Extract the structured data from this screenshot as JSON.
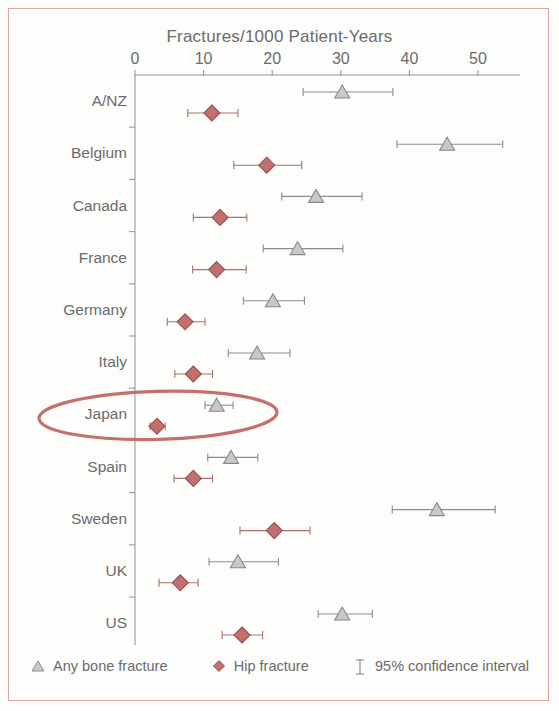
{
  "figure": {
    "border_color": "#dfa3a0",
    "background": "#fdfdfc"
  },
  "chart_data": {
    "type": "scatter",
    "title": "Fractures/1000 Patient-Years",
    "xlabel": "Fractures/1000 Patient-Years",
    "ylabel": "",
    "orientation": "horizontal",
    "xlim": [
      0,
      55
    ],
    "xticks": [
      0,
      10,
      20,
      30,
      40,
      50
    ],
    "xtick_labels": [
      "0",
      "10",
      "20",
      "30",
      "40",
      "50"
    ],
    "grid": false,
    "legend_position": "bottom",
    "categories": [
      "A/NZ",
      "Belgium",
      "Canada",
      "France",
      "Germany",
      "Italy",
      "Japan",
      "Spain",
      "Sweden",
      "UK",
      "US"
    ],
    "series": [
      {
        "name": "Any bone fracture",
        "marker": "triangle",
        "color": "#c9c9c9",
        "edge_color": "#888888",
        "values": [
          30.2,
          45.5,
          26.4,
          23.7,
          20.1,
          17.8,
          11.9,
          14.0,
          44.0,
          15.0,
          30.2
        ],
        "ci_low": [
          24.5,
          38.2,
          21.4,
          18.7,
          15.8,
          13.6,
          10.2,
          10.6,
          37.5,
          10.8,
          26.7
        ],
        "ci_high": [
          37.6,
          53.6,
          33.1,
          30.3,
          24.7,
          22.6,
          14.3,
          17.9,
          52.5,
          20.9,
          34.6
        ]
      },
      {
        "name": "Hip fracture",
        "marker": "diamond",
        "color": "#c0706e",
        "edge_color": "#9c4e4c",
        "values": [
          11.2,
          19.2,
          12.4,
          11.9,
          7.3,
          8.5,
          3.2,
          8.5,
          20.3,
          6.6,
          15.6
        ],
        "ci_low": [
          7.7,
          14.4,
          8.5,
          8.4,
          4.7,
          5.8,
          2.2,
          5.7,
          15.3,
          3.5,
          12.7
        ],
        "ci_high": [
          15.0,
          24.3,
          16.3,
          16.2,
          10.2,
          11.3,
          4.4,
          11.3,
          25.5,
          9.2,
          18.6
        ]
      }
    ],
    "annotations": [
      {
        "type": "ellipse",
        "label": "japan-highlight-ellipse",
        "target_category": "Japan",
        "color": "#c4716d"
      }
    ]
  },
  "legend": {
    "items": [
      {
        "glyph": "triangle-marker-icon",
        "label": "Any bone fracture"
      },
      {
        "glyph": "diamond-marker-icon",
        "label": "Hip fracture"
      },
      {
        "glyph": "error-bar-icon",
        "label": "95% confidence interval"
      }
    ]
  }
}
